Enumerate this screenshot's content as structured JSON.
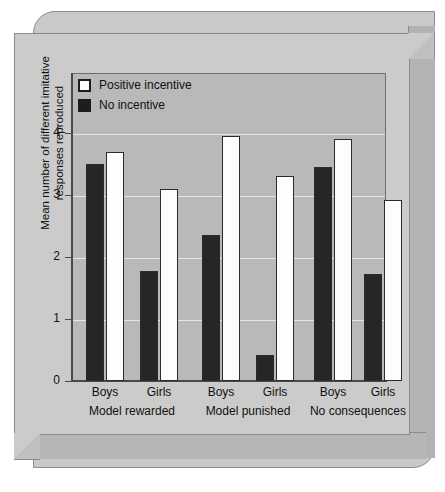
{
  "chart_data": {
    "type": "bar",
    "title": "",
    "xlabel": "",
    "ylabel": "Mean number of different imitative responses reproduced",
    "ylim": [
      0,
      4.3
    ],
    "yticks": [
      "0",
      "1",
      "2",
      "3",
      "4"
    ],
    "grid": true,
    "legend_position": "top-left",
    "categories": [
      "Boys",
      "Girls",
      "Boys",
      "Girls",
      "Boys",
      "Girls"
    ],
    "groups": [
      {
        "label": "Model rewarded",
        "subgroups": [
          {
            "label": "Boys",
            "no_incentive": 3.5,
            "positive_incentive": 3.7
          },
          {
            "label": "Girls",
            "no_incentive": 1.78,
            "positive_incentive": 3.1
          }
        ]
      },
      {
        "label": "Model punished",
        "subgroups": [
          {
            "label": "Boys",
            "no_incentive": 2.35,
            "positive_incentive": 3.95
          },
          {
            "label": "Girls",
            "no_incentive": 0.42,
            "positive_incentive": 3.3
          }
        ]
      },
      {
        "label": "No consequences",
        "subgroups": [
          {
            "label": "Boys",
            "no_incentive": 3.45,
            "positive_incentive": 3.9
          },
          {
            "label": "Girls",
            "no_incentive": 1.72,
            "positive_incentive": 2.92
          }
        ]
      }
    ],
    "series": [
      {
        "name": "No incentive",
        "color": "#262626",
        "values": [
          3.5,
          1.78,
          2.35,
          0.42,
          3.45,
          1.72
        ]
      },
      {
        "name": "Positive incentive",
        "color": "#fdfdfd",
        "values": [
          3.7,
          3.1,
          3.95,
          3.3,
          3.9,
          2.92
        ]
      }
    ]
  },
  "legend": {
    "items": [
      {
        "label": "Positive incentive",
        "swatch": "light"
      },
      {
        "label": "No incentive",
        "swatch": "dark"
      }
    ]
  },
  "colors": {
    "plot_background": "#b9b9b9",
    "card_background": "#cbcbcb",
    "gridline": "#e6e6e6",
    "axis": "#4a4a4a",
    "bar_dark": "#262626",
    "bar_light": "#fdfdfd"
  }
}
